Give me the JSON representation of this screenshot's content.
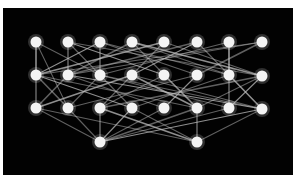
{
  "diagram": {
    "type": "network-graph",
    "background": "#020202",
    "node_color": "#f4f4f4",
    "edge_color": "#bdbdbd",
    "node_radius": 5.5,
    "nodes": [
      {
        "id": "a1",
        "x": 36,
        "y": 42
      },
      {
        "id": "a2",
        "x": 68,
        "y": 42
      },
      {
        "id": "a3",
        "x": 100,
        "y": 42
      },
      {
        "id": "a4",
        "x": 132,
        "y": 42
      },
      {
        "id": "a5",
        "x": 164,
        "y": 42
      },
      {
        "id": "a6",
        "x": 197,
        "y": 42
      },
      {
        "id": "a7",
        "x": 229,
        "y": 42
      },
      {
        "id": "a8",
        "x": 262,
        "y": 42
      },
      {
        "id": "b1",
        "x": 36,
        "y": 75
      },
      {
        "id": "b2",
        "x": 68,
        "y": 75
      },
      {
        "id": "b3",
        "x": 100,
        "y": 75
      },
      {
        "id": "b4",
        "x": 132,
        "y": 75
      },
      {
        "id": "b5",
        "x": 164,
        "y": 75
      },
      {
        "id": "b6",
        "x": 197,
        "y": 75
      },
      {
        "id": "b7",
        "x": 229,
        "y": 75
      },
      {
        "id": "b8",
        "x": 262,
        "y": 76
      },
      {
        "id": "c1",
        "x": 36,
        "y": 108
      },
      {
        "id": "c2",
        "x": 68,
        "y": 108
      },
      {
        "id": "c3",
        "x": 100,
        "y": 108
      },
      {
        "id": "c4",
        "x": 132,
        "y": 108
      },
      {
        "id": "c5",
        "x": 164,
        "y": 108
      },
      {
        "id": "c6",
        "x": 197,
        "y": 108
      },
      {
        "id": "c7",
        "x": 229,
        "y": 108
      },
      {
        "id": "c8",
        "x": 262,
        "y": 109
      },
      {
        "id": "d1",
        "x": 100,
        "y": 142
      },
      {
        "id": "d2",
        "x": 197,
        "y": 142
      }
    ],
    "edges": [
      [
        "a1",
        "b1"
      ],
      [
        "a1",
        "b3"
      ],
      [
        "a1",
        "c2"
      ],
      [
        "a2",
        "b2"
      ],
      [
        "a2",
        "b5"
      ],
      [
        "a2",
        "c4"
      ],
      [
        "a3",
        "b3"
      ],
      [
        "a3",
        "b6"
      ],
      [
        "a3",
        "b1"
      ],
      [
        "a4",
        "b2"
      ],
      [
        "a4",
        "b7"
      ],
      [
        "a4",
        "c6"
      ],
      [
        "a5",
        "b1"
      ],
      [
        "a5",
        "b8"
      ],
      [
        "a5",
        "c3"
      ],
      [
        "a6",
        "b2"
      ],
      [
        "a6",
        "b4"
      ],
      [
        "a6",
        "c8"
      ],
      [
        "a7",
        "b7"
      ],
      [
        "a7",
        "b3"
      ],
      [
        "a7",
        "c7"
      ],
      [
        "a8",
        "b6"
      ],
      [
        "a8",
        "b2"
      ],
      [
        "a8",
        "b1"
      ],
      [
        "a4",
        "b8"
      ],
      [
        "a2",
        "b8"
      ],
      [
        "a3",
        "b7"
      ],
      [
        "b1",
        "c1"
      ],
      [
        "b1",
        "c4"
      ],
      [
        "b1",
        "c6"
      ],
      [
        "b1",
        "c2"
      ],
      [
        "b2",
        "c5"
      ],
      [
        "b2",
        "c8"
      ],
      [
        "b2",
        "c1"
      ],
      [
        "b3",
        "c7"
      ],
      [
        "b3",
        "c2"
      ],
      [
        "b4",
        "c1"
      ],
      [
        "b4",
        "c8"
      ],
      [
        "b5",
        "c3"
      ],
      [
        "b5",
        "c6"
      ],
      [
        "b6",
        "c5"
      ],
      [
        "b6",
        "c2"
      ],
      [
        "b7",
        "c8"
      ],
      [
        "b7",
        "c4"
      ],
      [
        "b8",
        "c7"
      ],
      [
        "b8",
        "c3"
      ],
      [
        "b8",
        "c6"
      ],
      [
        "b3",
        "c8"
      ],
      [
        "b4",
        "c6"
      ],
      [
        "c1",
        "d1"
      ],
      [
        "c2",
        "d1"
      ],
      [
        "c3",
        "d1"
      ],
      [
        "c4",
        "d1"
      ],
      [
        "c5",
        "d1"
      ],
      [
        "c6",
        "d1"
      ],
      [
        "c7",
        "d1"
      ],
      [
        "c8",
        "d1"
      ],
      [
        "c6",
        "d2"
      ],
      [
        "c4",
        "d2"
      ],
      [
        "c1",
        "d2"
      ],
      [
        "c3",
        "d2"
      ],
      [
        "c8",
        "d2"
      ]
    ]
  }
}
